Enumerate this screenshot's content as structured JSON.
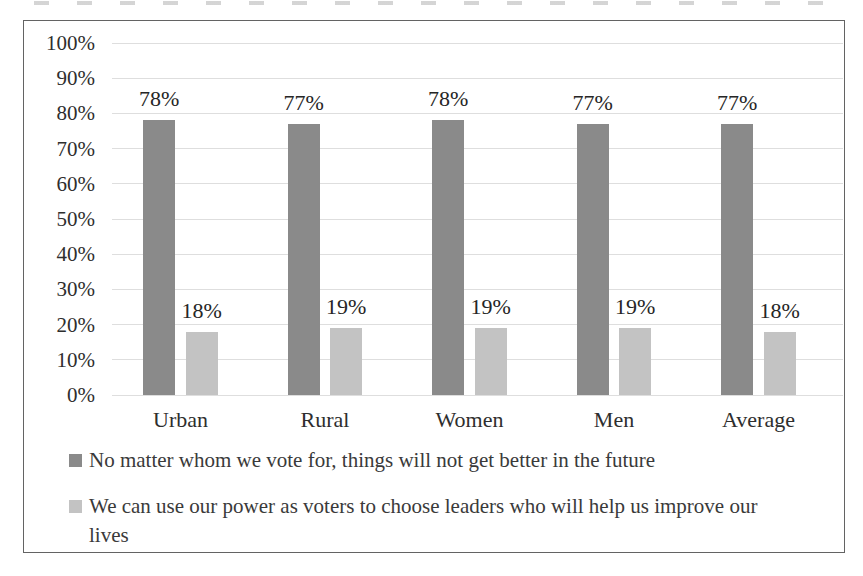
{
  "chart_data": {
    "type": "bar",
    "categories": [
      "Urban",
      "Rural",
      "Women",
      "Men",
      "Average"
    ],
    "series": [
      {
        "name": "No matter whom we vote for, things will not get better in the future",
        "color": "#8a8a8a",
        "values": [
          78,
          77,
          78,
          77,
          77
        ]
      },
      {
        "name": "We can use our power as voters to choose leaders who will help us improve our lives",
        "color": "#c3c3c3",
        "values": [
          18,
          19,
          19,
          19,
          18
        ]
      }
    ],
    "data_label_suffix": "%",
    "ytick_labels": [
      "0%",
      "10%",
      "20%",
      "30%",
      "40%",
      "50%",
      "60%",
      "70%",
      "80%",
      "90%",
      "100%"
    ],
    "ylim": [
      0,
      100
    ],
    "grid": true,
    "legend_position": "bottom-left",
    "title": "",
    "xlabel": "",
    "ylabel": "",
    "gridline_color": "#dedede",
    "border_color": "#636363",
    "axis_text_color": "#2e2e2e"
  }
}
